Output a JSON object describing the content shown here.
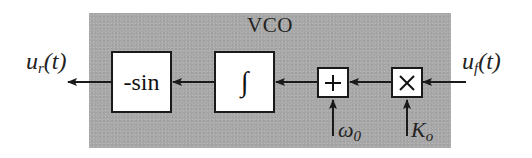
{
  "diagram": {
    "title": "VCO",
    "colors": {
      "region_fill": "#a9a9a9",
      "block_fill": "#ffffff",
      "line": "#1a1a1a"
    },
    "blocks": [
      {
        "id": "neg-sin",
        "label": "-sin"
      },
      {
        "id": "integrator",
        "label": "∫"
      },
      {
        "id": "adder",
        "label": "+"
      },
      {
        "id": "multiplier",
        "label": "×"
      }
    ],
    "signals": {
      "output": {
        "base": "u",
        "sub": "r",
        "suffix": "(t)"
      },
      "input": {
        "base": "u",
        "sub": "f",
        "suffix": "(t)"
      },
      "offset": {
        "base": "ω",
        "sub": "0"
      },
      "gain": {
        "base": "K",
        "sub": "o"
      }
    },
    "connections": [
      {
        "from": "input",
        "to": "multiplier"
      },
      {
        "from": "gain",
        "to": "multiplier"
      },
      {
        "from": "multiplier",
        "to": "adder"
      },
      {
        "from": "offset",
        "to": "adder"
      },
      {
        "from": "adder",
        "to": "integrator"
      },
      {
        "from": "integrator",
        "to": "neg-sin"
      },
      {
        "from": "neg-sin",
        "to": "output"
      }
    ]
  }
}
